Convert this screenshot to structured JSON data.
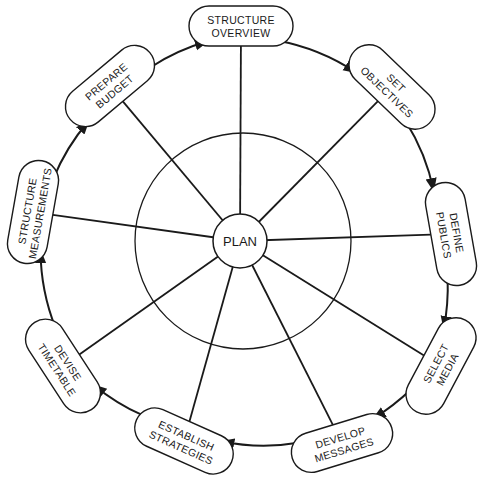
{
  "diagram": {
    "type": "cycle-hub",
    "center": {
      "label": "PLAN"
    },
    "colors": {
      "stroke": "#1a1a1a",
      "background": "#ffffff"
    },
    "nodes": [
      {
        "id": "structure-overview",
        "line1": "STRUCTURE",
        "line2": "OVERVIEW",
        "cx": 241,
        "cy": 26,
        "rot": 0
      },
      {
        "id": "set-objectives",
        "line1": "SET",
        "line2": "OBJECTIVES",
        "cx": 392,
        "cy": 87,
        "rot": 44
      },
      {
        "id": "define-publics",
        "line1": "DEFINE",
        "line2": "PUBLICS",
        "cx": 451,
        "cy": 234,
        "rot": 80
      },
      {
        "id": "select-media",
        "line1": "SELECT",
        "line2": "MEDIA",
        "cx": 441,
        "cy": 366,
        "rot": -62
      },
      {
        "id": "develop-messages",
        "line1": "DEVELOP",
        "line2": "MESSAGES",
        "cx": 342,
        "cy": 443,
        "rot": -17
      },
      {
        "id": "establish-strategies",
        "line1": "ESTABLISH",
        "line2": "STRATEGIES",
        "cx": 184,
        "cy": 441,
        "rot": 24
      },
      {
        "id": "devise-timetable",
        "line1": "DEVISE",
        "line2": "TIMETABLE",
        "cx": 63,
        "cy": 366,
        "rot": 57
      },
      {
        "id": "structure-measurements",
        "line1": "STRUCTURE",
        "line2": "MEASUREMENTS",
        "cx": 33,
        "cy": 212,
        "rot": -80
      },
      {
        "id": "prepare-budget",
        "line1": "PREPARE",
        "line2": "BUDGET",
        "cx": 110,
        "cy": 86,
        "rot": -40
      }
    ],
    "flow": "clockwise from STRUCTURE OVERVIEW through each node back to STRUCTURE OVERVIEW"
  }
}
